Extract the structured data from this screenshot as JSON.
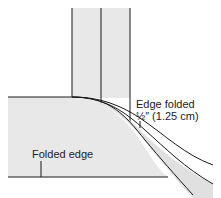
{
  "diagram": {
    "labels": {
      "edge_folded_line1": "Edge folded",
      "edge_folded_line2": "½″ (1.25 cm)",
      "folded_edge": "Folded edge"
    },
    "colors": {
      "fabric_fill": "#e8e8e8",
      "line": "#1a1a1a",
      "background": "#ffffff"
    }
  }
}
